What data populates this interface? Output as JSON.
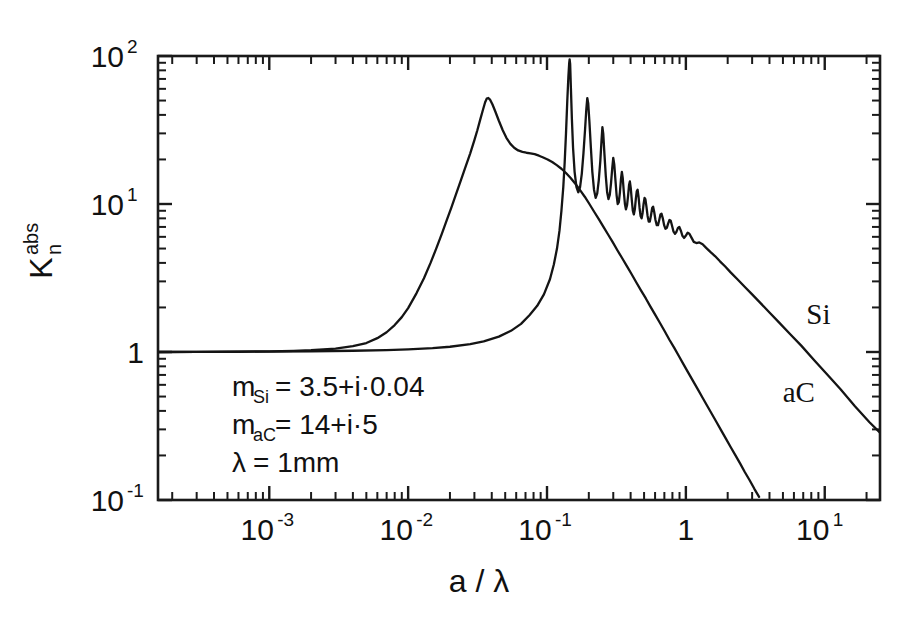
{
  "figure": {
    "background_color": "#ffffff",
    "ink_color": "#141414"
  },
  "chart_data": {
    "type": "line",
    "title": "",
    "xlabel": "a / λ",
    "ylabel": "K",
    "ylabel_sub": "n",
    "ylabel_sup": "abs",
    "xscale": "log",
    "yscale": "log",
    "xlim": [
      0.000158,
      25.0
    ],
    "ylim": [
      0.1,
      100.0
    ],
    "grid": false,
    "legend": "inline-curve-labels",
    "x_tick_labels": [
      {
        "value": 0.001,
        "mantissa": "10",
        "exponent": "-3"
      },
      {
        "value": 0.01,
        "mantissa": "10",
        "exponent": "-2"
      },
      {
        "value": 0.1,
        "mantissa": "10",
        "exponent": "-1"
      },
      {
        "value": 1,
        "mantissa": "1",
        "exponent": ""
      },
      {
        "value": 10,
        "mantissa": "10",
        "exponent": "1"
      }
    ],
    "y_tick_labels": [
      {
        "value": 100,
        "mantissa": "10",
        "exponent": "2"
      },
      {
        "value": 10,
        "mantissa": "10",
        "exponent": "1"
      },
      {
        "value": 1,
        "mantissa": "1",
        "exponent": ""
      },
      {
        "value": 0.1,
        "mantissa": "10",
        "exponent": "-1"
      }
    ],
    "annotations": [
      {
        "name": "m-si",
        "text": "m",
        "sub": "Si",
        "rest": " =  3.5+i·0.04"
      },
      {
        "name": "m-ac",
        "text": "m",
        "sub": "aC",
        "rest": " =  14+i·5"
      },
      {
        "name": "lambda",
        "text": "λ",
        "sub": "",
        "rest": " =  1mm"
      }
    ],
    "series": [
      {
        "name": "Si",
        "label": "Si",
        "label_x": 9.0,
        "label_y": 1.55,
        "points": [
          [
            0.000158,
            1.0
          ],
          [
            0.0003,
            1.002
          ],
          [
            0.0006,
            1.004
          ],
          [
            0.001,
            1.007
          ],
          [
            0.002,
            1.012
          ],
          [
            0.004,
            1.02
          ],
          [
            0.007,
            1.031
          ],
          [
            0.01,
            1.042
          ],
          [
            0.015,
            1.062
          ],
          [
            0.02,
            1.085
          ],
          [
            0.028,
            1.13
          ],
          [
            0.035,
            1.18
          ],
          [
            0.045,
            1.27
          ],
          [
            0.055,
            1.39
          ],
          [
            0.065,
            1.55
          ],
          [
            0.075,
            1.78
          ],
          [
            0.085,
            2.05
          ],
          [
            0.095,
            2.45
          ],
          [
            0.105,
            3.1
          ],
          [
            0.112,
            3.9
          ],
          [
            0.118,
            5.0
          ],
          [
            0.123,
            6.6
          ],
          [
            0.127,
            9.0
          ],
          [
            0.131,
            13.0
          ],
          [
            0.134,
            19.0
          ],
          [
            0.137,
            30.0
          ],
          [
            0.14,
            50.0
          ],
          [
            0.1425,
            72.0
          ],
          [
            0.1445,
            90.0
          ],
          [
            0.1455,
            95.0
          ],
          [
            0.1468,
            88.0
          ],
          [
            0.1485,
            62.0
          ],
          [
            0.151,
            38.0
          ],
          [
            0.154,
            24.0
          ],
          [
            0.158,
            16.5
          ],
          [
            0.163,
            13.0
          ],
          [
            0.168,
            12.0
          ],
          [
            0.173,
            13.0
          ],
          [
            0.178,
            16.0
          ],
          [
            0.183,
            22.0
          ],
          [
            0.188,
            32.0
          ],
          [
            0.192,
            44.0
          ],
          [
            0.195,
            52.0
          ],
          [
            0.198,
            48.0
          ],
          [
            0.202,
            36.0
          ],
          [
            0.207,
            24.0
          ],
          [
            0.212,
            16.5
          ],
          [
            0.218,
            12.5
          ],
          [
            0.224,
            11.0
          ],
          [
            0.23,
            11.8
          ],
          [
            0.236,
            14.5
          ],
          [
            0.242,
            19.5
          ],
          [
            0.247,
            27.0
          ],
          [
            0.2505,
            33.0
          ],
          [
            0.254,
            30.0
          ],
          [
            0.259,
            22.0
          ],
          [
            0.265,
            15.5
          ],
          [
            0.271,
            12.0
          ],
          [
            0.277,
            10.8
          ],
          [
            0.283,
            11.5
          ],
          [
            0.289,
            13.8
          ],
          [
            0.295,
            17.5
          ],
          [
            0.3,
            20.5
          ],
          [
            0.305,
            18.5
          ],
          [
            0.311,
            14.5
          ],
          [
            0.317,
            11.5
          ],
          [
            0.323,
            10.0
          ],
          [
            0.329,
            10.3
          ],
          [
            0.335,
            12.0
          ],
          [
            0.341,
            14.8
          ],
          [
            0.346,
            16.5
          ],
          [
            0.351,
            15.0
          ],
          [
            0.357,
            12.2
          ],
          [
            0.364,
            10.0
          ],
          [
            0.37,
            9.2
          ],
          [
            0.377,
            9.8
          ],
          [
            0.384,
            11.5
          ],
          [
            0.39,
            13.5
          ],
          [
            0.395,
            14.2
          ],
          [
            0.401,
            12.8
          ],
          [
            0.408,
            10.6
          ],
          [
            0.415,
            9.0
          ],
          [
            0.422,
            8.5
          ],
          [
            0.429,
            9.2
          ],
          [
            0.436,
            10.8
          ],
          [
            0.443,
            12.2
          ],
          [
            0.449,
            12.5
          ],
          [
            0.456,
            11.2
          ],
          [
            0.464,
            9.4
          ],
          [
            0.472,
            8.3
          ],
          [
            0.48,
            8.0
          ],
          [
            0.488,
            8.7
          ],
          [
            0.496,
            10.0
          ],
          [
            0.504,
            11.0
          ],
          [
            0.511,
            10.8
          ],
          [
            0.52,
            9.6
          ],
          [
            0.53,
            8.3
          ],
          [
            0.54,
            7.6
          ],
          [
            0.55,
            7.6
          ],
          [
            0.561,
            8.4
          ],
          [
            0.572,
            9.4
          ],
          [
            0.581,
            9.6
          ],
          [
            0.592,
            8.8
          ],
          [
            0.604,
            7.8
          ],
          [
            0.617,
            7.2
          ],
          [
            0.63,
            7.2
          ],
          [
            0.643,
            7.8
          ],
          [
            0.656,
            8.5
          ],
          [
            0.668,
            8.6
          ],
          [
            0.682,
            8.0
          ],
          [
            0.697,
            7.2
          ],
          [
            0.713,
            6.8
          ],
          [
            0.729,
            6.9
          ],
          [
            0.746,
            7.4
          ],
          [
            0.762,
            7.8
          ],
          [
            0.778,
            7.7
          ],
          [
            0.796,
            7.1
          ],
          [
            0.815,
            6.5
          ],
          [
            0.835,
            6.3
          ],
          [
            0.856,
            6.5
          ],
          [
            0.877,
            6.9
          ],
          [
            0.897,
            7.0
          ],
          [
            0.92,
            6.6
          ],
          [
            0.944,
            6.1
          ],
          [
            0.97,
            5.9
          ],
          [
            0.998,
            6.1
          ],
          [
            1.03,
            6.4
          ],
          [
            1.06,
            6.3
          ],
          [
            1.1,
            5.9
          ],
          [
            1.14,
            5.55
          ],
          [
            1.19,
            5.45
          ],
          [
            1.25,
            5.5
          ],
          [
            1.32,
            5.35
          ],
          [
            1.4,
            5.05
          ],
          [
            1.5,
            4.75
          ],
          [
            1.62,
            4.45
          ],
          [
            1.76,
            4.1
          ],
          [
            1.92,
            3.78
          ],
          [
            2.1,
            3.45
          ],
          [
            2.35,
            3.1
          ],
          [
            2.65,
            2.76
          ],
          [
            3.0,
            2.45
          ],
          [
            3.45,
            2.14
          ],
          [
            4.0,
            1.85
          ],
          [
            4.7,
            1.58
          ],
          [
            5.6,
            1.33
          ],
          [
            6.8,
            1.1
          ],
          [
            8.4,
            0.88
          ],
          [
            10.5,
            0.7
          ],
          [
            13.0,
            0.56
          ],
          [
            16.5,
            0.43
          ],
          [
            21.0,
            0.335
          ],
          [
            25.0,
            0.285
          ]
        ]
      },
      {
        "name": "aC",
        "label": "aC",
        "label_x": 6.5,
        "label_y": 0.46,
        "points": [
          [
            0.000158,
            1.0
          ],
          [
            0.0003,
            1.003
          ],
          [
            0.0006,
            1.006
          ],
          [
            0.001,
            1.01
          ],
          [
            0.0015,
            1.018
          ],
          [
            0.002,
            1.028
          ],
          [
            0.003,
            1.055
          ],
          [
            0.004,
            1.095
          ],
          [
            0.005,
            1.15
          ],
          [
            0.006,
            1.24
          ],
          [
            0.007,
            1.36
          ],
          [
            0.008,
            1.52
          ],
          [
            0.009,
            1.72
          ],
          [
            0.01,
            1.98
          ],
          [
            0.0115,
            2.5
          ],
          [
            0.013,
            3.15
          ],
          [
            0.0145,
            4.0
          ],
          [
            0.016,
            5.05
          ],
          [
            0.0175,
            6.3
          ],
          [
            0.019,
            7.8
          ],
          [
            0.0205,
            9.5
          ],
          [
            0.022,
            11.5
          ],
          [
            0.024,
            14.5
          ],
          [
            0.026,
            18.0
          ],
          [
            0.028,
            22.0
          ],
          [
            0.03,
            27.0
          ],
          [
            0.0315,
            31.5
          ],
          [
            0.033,
            37.0
          ],
          [
            0.0345,
            43.0
          ],
          [
            0.0358,
            48.5
          ],
          [
            0.0368,
            51.5
          ],
          [
            0.0378,
            52.0
          ],
          [
            0.039,
            50.5
          ],
          [
            0.0405,
            47.0
          ],
          [
            0.0425,
            42.0
          ],
          [
            0.045,
            36.5
          ],
          [
            0.048,
            31.5
          ],
          [
            0.051,
            28.0
          ],
          [
            0.0545,
            25.5
          ],
          [
            0.058,
            24.0
          ],
          [
            0.062,
            23.0
          ],
          [
            0.0665,
            22.5
          ],
          [
            0.071,
            22.2
          ],
          [
            0.076,
            22.0
          ],
          [
            0.0815,
            21.7
          ],
          [
            0.0875,
            21.2
          ],
          [
            0.094,
            20.6
          ],
          [
            0.101,
            20.0
          ],
          [
            0.109,
            19.2
          ],
          [
            0.1175,
            18.3
          ],
          [
            0.127,
            17.3
          ],
          [
            0.137,
            16.2
          ],
          [
            0.148,
            15.0
          ],
          [
            0.16,
            13.7
          ],
          [
            0.173,
            12.4
          ],
          [
            0.187,
            11.2
          ],
          [
            0.202,
            10.0
          ],
          [
            0.218,
            8.9
          ],
          [
            0.236,
            7.9
          ],
          [
            0.255,
            7.0
          ],
          [
            0.276,
            6.2
          ],
          [
            0.298,
            5.5
          ],
          [
            0.322,
            4.85
          ],
          [
            0.348,
            4.3
          ],
          [
            0.376,
            3.8
          ],
          [
            0.407,
            3.35
          ],
          [
            0.44,
            2.95
          ],
          [
            0.476,
            2.6
          ],
          [
            0.515,
            2.3
          ],
          [
            0.557,
            2.02
          ],
          [
            0.602,
            1.78
          ],
          [
            0.651,
            1.57
          ],
          [
            0.704,
            1.38
          ],
          [
            0.761,
            1.21
          ],
          [
            0.823,
            1.07
          ],
          [
            0.89,
            0.94
          ],
          [
            0.962,
            0.825
          ],
          [
            1.04,
            0.725
          ],
          [
            1.125,
            0.638
          ],
          [
            1.217,
            0.561
          ],
          [
            1.316,
            0.493
          ],
          [
            1.423,
            0.433
          ],
          [
            1.539,
            0.381
          ],
          [
            1.664,
            0.335
          ],
          [
            1.8,
            0.294
          ],
          [
            1.946,
            0.259
          ],
          [
            2.105,
            0.227
          ],
          [
            2.276,
            0.2
          ],
          [
            2.462,
            0.176
          ],
          [
            2.662,
            0.154
          ],
          [
            2.879,
            0.136
          ],
          [
            3.113,
            0.119
          ],
          [
            3.366,
            0.105
          ]
        ]
      }
    ]
  }
}
